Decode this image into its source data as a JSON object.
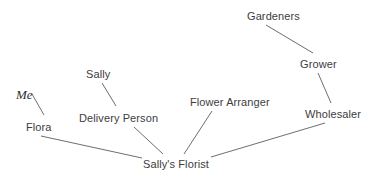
{
  "diagram": {
    "type": "node-link-graph",
    "background_color": "#ffffff",
    "edge_color": "#6e6e6e",
    "label_color": "#3d3d3d",
    "nodes": [
      {
        "id": "me",
        "label": "Me",
        "x": 16,
        "y": 88,
        "style": "serif-italic"
      },
      {
        "id": "flora",
        "label": "Flora",
        "x": 26,
        "y": 121,
        "style": "sans"
      },
      {
        "id": "sally",
        "label": "Sally",
        "x": 86,
        "y": 68,
        "style": "sans"
      },
      {
        "id": "delivery-person",
        "label": "Delivery Person",
        "x": 79,
        "y": 112,
        "style": "sans"
      },
      {
        "id": "flower-arranger",
        "label": "Flower Arranger",
        "x": 190,
        "y": 96,
        "style": "sans"
      },
      {
        "id": "sallys-florist",
        "label": "Sally's Florist",
        "x": 143,
        "y": 158,
        "style": "sans"
      },
      {
        "id": "gardeners",
        "label": "Gardeners",
        "x": 247,
        "y": 10,
        "style": "sans"
      },
      {
        "id": "grower",
        "label": "Grower",
        "x": 300,
        "y": 58,
        "style": "sans"
      },
      {
        "id": "wholesaler",
        "label": "Wholesaler",
        "x": 305,
        "y": 108,
        "style": "sans"
      }
    ],
    "edges": [
      {
        "id": "me-flora",
        "from": "me",
        "to": "flora",
        "x1": 32,
        "y1": 94,
        "x2": 44,
        "y2": 115
      },
      {
        "id": "flora-sallys-florist",
        "from": "flora",
        "to": "sallys-florist",
        "x1": 41,
        "y1": 136,
        "x2": 142,
        "y2": 158
      },
      {
        "id": "sally-delivery-person",
        "from": "sally",
        "to": "delivery-person",
        "x1": 102,
        "y1": 83,
        "x2": 116,
        "y2": 106
      },
      {
        "id": "delivery-sallys-florist",
        "from": "delivery-person",
        "to": "sallys-florist",
        "x1": 134,
        "y1": 127,
        "x2": 163,
        "y2": 154
      },
      {
        "id": "arranger-sallys-florist",
        "from": "flower-arranger",
        "to": "sallys-florist",
        "x1": 212,
        "y1": 111,
        "x2": 184,
        "y2": 154
      },
      {
        "id": "gardeners-grower",
        "from": "gardeners",
        "to": "grower",
        "x1": 266,
        "y1": 25,
        "x2": 313,
        "y2": 53
      },
      {
        "id": "grower-wholesaler",
        "from": "grower",
        "to": "wholesaler",
        "x1": 318,
        "y1": 73,
        "x2": 331,
        "y2": 103
      },
      {
        "id": "wholesaler-florist",
        "from": "wholesaler",
        "to": "sallys-florist",
        "x1": 325,
        "y1": 123,
        "x2": 211,
        "y2": 157
      }
    ]
  }
}
